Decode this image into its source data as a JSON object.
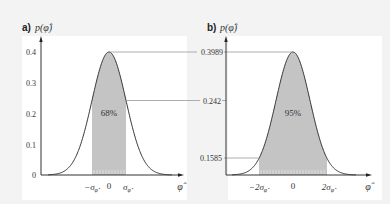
{
  "chart_data": [
    {
      "type": "area",
      "panel": "a",
      "panel_label": "a)",
      "ylabel": "p(φ̂)",
      "xlabel": "φ̂",
      "title": "",
      "distribution": "standard normal density",
      "mean": 0,
      "peak_value": 0.3989,
      "y_ticks": [
        "0",
        "0.1",
        "0.2",
        "0.3",
        "0.4"
      ],
      "y_tick_values": [
        0,
        0.1,
        0.2,
        0.3,
        0.4
      ],
      "x_ticks": [
        "−σφ̂",
        "0",
        "σφ̂"
      ],
      "x_tick_values": [
        -1,
        0,
        1
      ],
      "shaded_region": [
        -1,
        1
      ],
      "shaded_label": "68%",
      "reference_lines": [
        {
          "label": "0.3989",
          "value": 0.3989
        },
        {
          "label": "0.242",
          "value": 0.242
        }
      ],
      "ylim": [
        0,
        0.42
      ],
      "xlim": [
        -3.6,
        4.3
      ],
      "grid": false
    },
    {
      "type": "area",
      "panel": "b",
      "panel_label": "b)",
      "ylabel": "p(φ̂)",
      "xlabel": "φ̂",
      "title": "",
      "distribution": "standard normal density",
      "mean": 0,
      "peak_value": 0.3989,
      "y_ticks": [
        "0.1585",
        "0.242",
        "0.3989"
      ],
      "y_tick_values": [
        0.054,
        0.242,
        0.3989
      ],
      "x_ticks": [
        "−2σφ̂",
        "0",
        "2σφ̂"
      ],
      "x_tick_values": [
        -2,
        0,
        2
      ],
      "shaded_region": [
        -2,
        2
      ],
      "shaded_label": "95%",
      "reference_lines": [
        {
          "label": "0.3989",
          "value": 0.3989
        },
        {
          "label": "0.242",
          "value": 0.242
        },
        {
          "label": "0.1585",
          "value": 0.054
        }
      ],
      "ylim": [
        0,
        0.42
      ],
      "xlim": [
        -3.9,
        4.3
      ],
      "grid": false
    }
  ],
  "panels": {
    "a": {
      "label": "a)",
      "ylabel": "p(φ̂)",
      "xlabel": "φ̂",
      "yticks": [
        "0.4",
        "0.3",
        "0.2",
        "0.1",
        "0"
      ],
      "xticks": [
        "−σ",
        "0",
        "σ"
      ],
      "xtick_sub": "φ̂",
      "shaded_label": "68%"
    },
    "b": {
      "label": "b)",
      "ylabel": "p(φ̂)",
      "xlabel": "φ̂",
      "yticks": [
        "0.3989",
        "0.242",
        "0.1585"
      ],
      "xticks": [
        "−2σ",
        "0",
        "2σ"
      ],
      "xtick_sub": "φ̂",
      "shaded_label": "95%"
    }
  },
  "colors": {
    "background": "#f3f3f3",
    "plot_area": "#ffffff",
    "shade": "#c4c4c4",
    "curve": "#333333",
    "ref_line": "#999999"
  }
}
